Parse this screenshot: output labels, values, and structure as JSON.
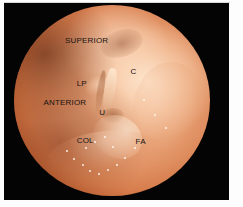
{
  "figure": {
    "kind": "otoscopic-endoscopic-view",
    "frame_background_color": "#050404",
    "page_background_color": "#fdfdfd"
  },
  "field_of_view": {
    "shape": "circle",
    "rim_color": "#7a2408",
    "drum_color": "#e79f73",
    "highlight_color": "#ffe9d2"
  },
  "annotations": [
    {
      "id": "superior",
      "label": "SUPERIOR",
      "x_pct": 26.0,
      "y_pct": 17.0
    },
    {
      "id": "lateral-process",
      "label": "LP",
      "x_pct": 32.0,
      "y_pct": 39.5
    },
    {
      "id": "cochlear-promontory",
      "label": "C",
      "x_pct": 59.5,
      "y_pct": 33.0
    },
    {
      "id": "anterior",
      "label": "ANTERIOR",
      "x_pct": 15.0,
      "y_pct": 49.0
    },
    {
      "id": "umbo",
      "label": "U",
      "x_pct": 43.5,
      "y_pct": 54.5
    },
    {
      "id": "cone-of-light",
      "label": "COL",
      "x_pct": 32.0,
      "y_pct": 69.0
    },
    {
      "id": "fibrous-annulus",
      "label": "FA",
      "x_pct": 62.0,
      "y_pct": 69.5
    }
  ],
  "specular_highlights": [
    {
      "x_pct": 30.0,
      "y_pct": 80.0,
      "size_px": 2
    },
    {
      "x_pct": 34.5,
      "y_pct": 83.5,
      "size_px": 2
    },
    {
      "x_pct": 38.5,
      "y_pct": 86.5,
      "size_px": 2
    },
    {
      "x_pct": 43.0,
      "y_pct": 88.0,
      "size_px": 2
    },
    {
      "x_pct": 47.5,
      "y_pct": 86.0,
      "size_px": 2
    },
    {
      "x_pct": 52.0,
      "y_pct": 83.0,
      "size_px": 2
    },
    {
      "x_pct": 26.5,
      "y_pct": 76.0,
      "size_px": 2
    },
    {
      "x_pct": 56.0,
      "y_pct": 79.5,
      "size_px": 2
    },
    {
      "x_pct": 41.0,
      "y_pct": 71.0,
      "size_px": 2
    },
    {
      "x_pct": 36.0,
      "y_pct": 74.5,
      "size_px": 2
    },
    {
      "x_pct": 50.0,
      "y_pct": 74.0,
      "size_px": 2
    },
    {
      "x_pct": 61.0,
      "y_pct": 74.5,
      "size_px": 2
    },
    {
      "x_pct": 46.0,
      "y_pct": 68.5,
      "size_px": 2
    },
    {
      "x_pct": 66.0,
      "y_pct": 49.0,
      "size_px": 2
    },
    {
      "x_pct": 71.5,
      "y_pct": 57.0,
      "size_px": 2
    },
    {
      "x_pct": 77.0,
      "y_pct": 64.0,
      "size_px": 2
    }
  ]
}
